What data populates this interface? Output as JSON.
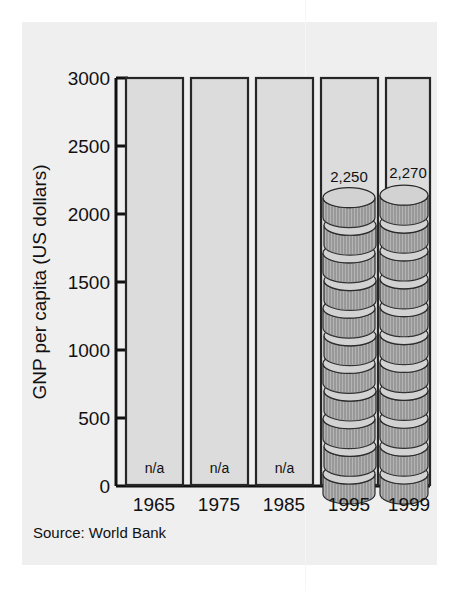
{
  "figure": {
    "background_color": "#efefef",
    "page_color": "#ffffff"
  },
  "source_note": "Source: World Bank",
  "chart_data": {
    "type": "bar",
    "title": "",
    "subtitle": "",
    "xlabel": "",
    "ylabel": "GNP per capita (US dollars)",
    "categories": [
      "1965",
      "1975",
      "1985",
      "1995",
      "1999"
    ],
    "values": [
      null,
      null,
      null,
      2250,
      2270
    ],
    "value_labels": [
      "n/a",
      "n/a",
      "n/a",
      "2,250",
      "2,270"
    ],
    "bar_labels_inside": [
      "n/a",
      "n/a",
      "n/a",
      "",
      ""
    ],
    "bar_labels_above": [
      "",
      "",
      "",
      "2,250",
      "2,270"
    ],
    "ylim": [
      0,
      3000
    ],
    "yticks": [
      0,
      500,
      1000,
      1500,
      2000,
      2500,
      3000
    ],
    "ytick_labels": [
      "0",
      "500",
      "1000",
      "1500",
      "2000",
      "2500",
      "3000"
    ],
    "grid": false,
    "legend": null,
    "legend_position": "none",
    "note": "Bars for 1965, 1975 and 1985 have no data (n/a) and are drawn as empty outlined columns; 1995 and 1999 are drawn as pictorial stacks of coins.",
    "series": [
      {
        "name": "GNP per capita",
        "values": [
          null,
          null,
          null,
          2250,
          2270
        ]
      }
    ],
    "marker_style": "coin-stack",
    "coin_counts": [
      0,
      0,
      0,
      11,
      11
    ],
    "colors": {
      "bar_fill": "#dcdcdc",
      "bar_stroke": "#262626",
      "coin_top": "#d2d2d2",
      "coin_side": "#b4b4b4",
      "axis": "#111111",
      "text": "#111111"
    }
  },
  "axis": {
    "y_title": "GNP per capita (US dollars)",
    "y_tick_0": "0",
    "y_tick_500": "500",
    "y_tick_1000": "1000",
    "y_tick_1500": "1500",
    "y_tick_2000": "2000",
    "y_tick_2500": "2500",
    "y_tick_3000": "3000"
  },
  "categories": {
    "c0": "1965",
    "c1": "1975",
    "c2": "1985",
    "c3": "1995",
    "c4": "1999"
  },
  "bar_text": {
    "na0": "n/a",
    "na1": "n/a",
    "na2": "n/a",
    "v3": "2,250",
    "v4": "2,270"
  }
}
